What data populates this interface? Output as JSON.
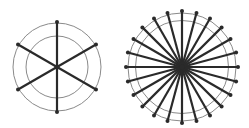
{
  "figures": [
    {
      "name": "wheel-6-spokes",
      "cx": 57,
      "cy": 67,
      "outer_radius": 44,
      "inner_radius": 31,
      "spoke_count": 6,
      "spoke_length": 45,
      "start_angle_deg": 90
    },
    {
      "name": "wheel-24-spokes",
      "cx": 182,
      "cy": 67,
      "outer_radius": 54,
      "inner_radius": 46.5,
      "spoke_count": 24,
      "spoke_length": 56,
      "start_angle_deg": 90
    }
  ],
  "colors": {
    "background": "#ffffff",
    "circle_stroke": "#8a8a8a",
    "spoke_stroke": "#2a2a2a",
    "dot_fill": "#2a2a2a"
  }
}
